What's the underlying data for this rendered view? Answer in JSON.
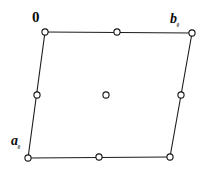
{
  "figure": {
    "name": "unit-cell-lattice-diagram",
    "type": "crystal-unit-cell",
    "background_color": "#ffffff",
    "line_color": "#1c1c1c",
    "marker_fill": "#ffffff",
    "marker_stroke": "#161616",
    "marker_radius": 3.1,
    "line_width": 1.1
  },
  "labels": {
    "origin": {
      "base": "0",
      "sub": ""
    },
    "b_axis": {
      "base": "b",
      "sub": "₀"
    },
    "a_axis": {
      "base": "a",
      "sub": "₀"
    }
  },
  "geometry": {
    "corners": [
      {
        "name": "origin-corner",
        "x": 45,
        "y": 32
      },
      {
        "name": "b-corner",
        "x": 192,
        "y": 33
      },
      {
        "name": "bottom-right-corner",
        "x": 170,
        "y": 157
      },
      {
        "name": "a-corner",
        "x": 28,
        "y": 158
      }
    ],
    "edge_midpoints": [
      {
        "name": "top-edge-midpoint",
        "x": 117,
        "y": 32
      },
      {
        "name": "right-edge-midpoint",
        "x": 181,
        "y": 95
      },
      {
        "name": "bottom-edge-midpoint",
        "x": 99,
        "y": 157
      },
      {
        "name": "left-edge-midpoint",
        "x": 37,
        "y": 95
      }
    ],
    "body_centre": {
      "name": "body-centre-point",
      "x": 106,
      "y": 95
    },
    "edges": [
      {
        "name": "top-edge",
        "x1": 45,
        "y1": 32,
        "x2": 192,
        "y2": 33
      },
      {
        "name": "right-edge",
        "x1": 192,
        "y1": 33,
        "x2": 170,
        "y2": 157
      },
      {
        "name": "bottom-edge",
        "x1": 170,
        "y1": 157,
        "x2": 28,
        "y2": 158
      },
      {
        "name": "left-edge",
        "x1": 28,
        "y1": 158,
        "x2": 45,
        "y2": 32
      }
    ]
  }
}
